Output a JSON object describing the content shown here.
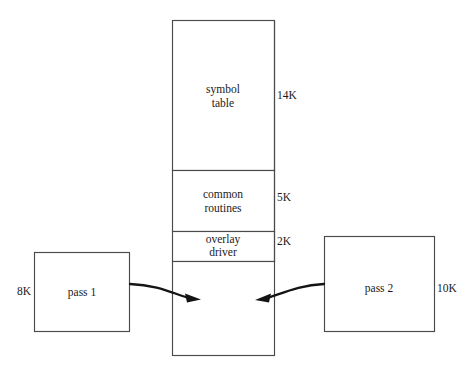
{
  "diagram": {
    "background_color": "#ffffff",
    "line_color": "#4a4a4a",
    "arrow_color": "#141414",
    "text_color": "#1a1a1a",
    "memory_column": {
      "name": "memory-column",
      "segments": [
        {
          "id": "symbol-table",
          "label_line1": "symbol",
          "label_line2": "table",
          "size": "14K"
        },
        {
          "id": "common-routines",
          "label_line1": "common",
          "label_line2": "routines",
          "size": "5K"
        },
        {
          "id": "overlay-driver",
          "label_line1": "overlay",
          "label_line2": "driver",
          "size": "2K"
        },
        {
          "id": "pass-area",
          "label_line1": "",
          "label_line2": "",
          "size": ""
        }
      ]
    },
    "left_box": {
      "name": "pass-1-box",
      "label": "pass 1",
      "size": "8K"
    },
    "right_box": {
      "name": "pass-2-box",
      "label": "pass 2",
      "size": "10K"
    },
    "arrows": [
      {
        "id": "pass1-to-memory",
        "direction": "right",
        "from": "pass 1",
        "to": "memory"
      },
      {
        "id": "pass2-to-memory",
        "direction": "left",
        "from": "pass 2",
        "to": "memory"
      }
    ]
  }
}
